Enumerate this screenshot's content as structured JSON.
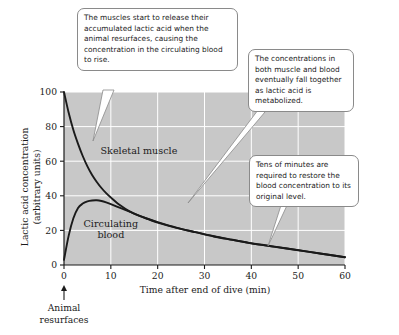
{
  "chart_data": {
    "type": "line",
    "title": "",
    "xlabel": "Time after end of dive (min)",
    "ylabel": "Lactic acid concentration (arbitrary units)",
    "ylabel_line1": "Lactic acid concentration",
    "ylabel_line2": "(arbitrary units)",
    "xlim": [
      0,
      60
    ],
    "ylim": [
      0,
      100
    ],
    "xticks": [
      0,
      10,
      20,
      30,
      40,
      50,
      60
    ],
    "yticks": [
      0,
      20,
      40,
      60,
      80,
      100
    ],
    "xtick_labels": [
      "0",
      "10",
      "20",
      "30",
      "40",
      "50",
      "60"
    ],
    "ytick_labels": [
      "0",
      "20",
      "40",
      "60",
      "80",
      "100"
    ],
    "grid": true,
    "grid_color": "#ffffff",
    "plot_background": "#c8c8c8",
    "curve_color": "#1a1a1a",
    "legend_position": "inline-labels",
    "x": [
      0,
      1,
      2,
      3,
      4,
      5,
      6,
      7,
      8,
      9,
      10,
      12,
      14,
      16,
      18,
      20,
      24,
      28,
      32,
      36,
      40,
      45,
      50,
      55,
      60
    ],
    "series": [
      {
        "name": "Skeletal muscle",
        "label_x": 16,
        "label_y": 64,
        "values": [
          100,
          88,
          78,
          70,
          63,
          57,
          52,
          48,
          44.5,
          41.5,
          39,
          34.5,
          31,
          28.5,
          26.5,
          24.5,
          21.5,
          19,
          16.5,
          14.5,
          12.5,
          10.5,
          8.5,
          6.5,
          4.5
        ]
      },
      {
        "name": "Circulating blood",
        "label_x": 10,
        "label_y": 22,
        "label_line1": "Circulating",
        "label_line2": "blood",
        "values": [
          3,
          17,
          27,
          33,
          35.5,
          36.8,
          37.3,
          37.4,
          37,
          36.2,
          35.2,
          33,
          30.8,
          28.6,
          26.6,
          24.8,
          21.6,
          19,
          16.6,
          14.6,
          12.6,
          10.6,
          8.6,
          6.5,
          4.5
        ]
      }
    ],
    "annotations": [
      {
        "name": "animal-resurfaces",
        "line1": "Animal",
        "line2": "resurfaces",
        "at_x": 0,
        "arrow": "up"
      }
    ]
  },
  "callouts": [
    {
      "id": "muscle-release",
      "text": "The muscles start to release their accumulated lactic acid when the animal resurfaces, causing the concentration in the circulating blood to rise."
    },
    {
      "id": "both-fall",
      "text": "The concentrations in both muscle and blood eventually fall together as lactic acid is metabolized."
    },
    {
      "id": "tens-minutes",
      "text": "Tens of minutes are required to restore the blood concentration to its original level."
    }
  ]
}
